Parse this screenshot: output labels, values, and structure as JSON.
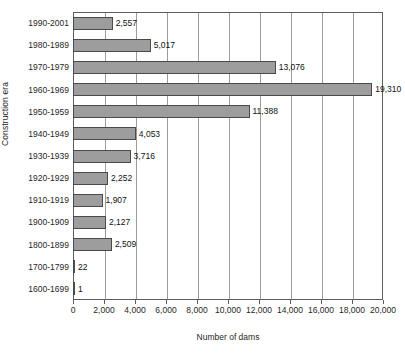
{
  "chart_data": {
    "type": "bar",
    "orientation": "horizontal",
    "title": "",
    "xlabel": "Number of dams",
    "ylabel": "Construction era",
    "categories": [
      "1990-2001",
      "1980-1989",
      "1970-1979",
      "1960-1969",
      "1950-1959",
      "1940-1949",
      "1930-1939",
      "1920-1929",
      "1910-1919",
      "1900-1909",
      "1800-1899",
      "1700-1799",
      "1600-1699"
    ],
    "values": [
      2557,
      5017,
      13076,
      19310,
      11388,
      4053,
      3716,
      2252,
      1907,
      2127,
      2509,
      22,
      1
    ],
    "value_labels": [
      "2,557",
      "5,017",
      "13,076",
      "19,310",
      "11,388",
      "4,053",
      "3,716",
      "2,252",
      "1,907",
      "2,127",
      "2,509",
      "22",
      "1"
    ],
    "xlim": [
      0,
      20000
    ],
    "xticks": [
      0,
      2000,
      4000,
      6000,
      8000,
      10000,
      12000,
      14000,
      16000,
      18000,
      20000
    ],
    "xtick_labels": [
      "0",
      "2,000",
      "4,000",
      "6,000",
      "8,000",
      "10,000",
      "12,000",
      "14,000",
      "16,000",
      "18,000",
      "20,000"
    ],
    "grid": true,
    "grid_axis": "x",
    "legend": false,
    "bar_color": "#9d9d9d",
    "bar_border_color": "#4a4a4a",
    "grid_color": "#9b9b9b",
    "frame_color": "#5d5d5d"
  }
}
